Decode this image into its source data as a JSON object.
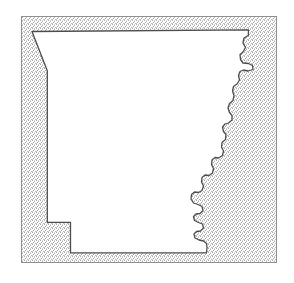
{
  "figure": {
    "title": "Arkansas state outline map",
    "caption": "",
    "subject": "Arkansas",
    "type": "state-outline-map"
  },
  "canvas": {
    "width": 294,
    "height": 283,
    "background_color": "#ffffff"
  },
  "bounding_box": {
    "name": "map-frame",
    "x": 21,
    "y": 16,
    "width": 256,
    "height": 247,
    "stroke_color": "#8f8f8f",
    "stroke_width": 1,
    "fill_color": "#dcdcdc",
    "fill_style": "stipple"
  },
  "state_shape": {
    "name": "arkansas-outline",
    "fill_color": "#ffffff",
    "stroke_color": "#4d4d4d",
    "stroke_width": 1.3,
    "path": "M 32.0 31.5 L 248.5 29.8 L 248.3 35.5 L 244.0 38.0 L 243.0 43.0 L 245.5 47.5 L 243.0 52.0 L 240.0 54.5 L 240.5 59.5 L 243.0 63.0 L 248.5 63.5 L 252.5 65.5 L 253.0 69.5 L 248.0 71.0 L 243.5 70.0 L 240.0 71.5 L 238.5 75.5 L 239.5 80.0 L 237.0 84.0 L 233.5 86.5 L 232.5 91.0 L 234.0 95.5 L 233.0 100.5 L 229.5 103.5 L 228.0 108.0 L 229.5 112.5 L 232.0 115.5 L 232.0 120.0 L 228.5 123.0 L 225.0 124.0 L 222.5 127.0 L 223.5 131.5 L 226.0 134.5 L 225.5 139.5 L 222.0 142.5 L 221.5 147.0 L 223.5 151.0 L 222.5 155.5 L 218.5 158.0 L 215.0 157.5 L 212.0 160.0 L 211.5 164.5 L 213.5 168.5 L 212.5 173.0 L 209.0 175.5 L 205.0 175.0 L 202.0 177.5 L 201.5 182.0 L 203.5 186.0 L 202.0 190.5 L 198.5 192.5 L 194.5 192.0 L 191.5 194.5 L 191.0 199.0 L 193.5 203.0 L 198.0 204.5 L 202.0 206.5 L 203.0 210.5 L 200.0 213.5 L 196.0 214.0 L 193.5 216.5 L 194.5 220.5 L 198.5 222.5 L 202.5 224.0 L 203.5 228.0 L 200.5 231.0 L 196.5 231.5 L 194.0 234.0 L 195.0 238.0 L 199.0 240.0 L 203.5 241.0 L 206.5 243.5 L 207.0 247.5 L 206.5 252.8 L 70.5 252.8 L 70.5 222.3 L 47.3 222.3 L 47.3 70.8 Z"
  },
  "elements": {
    "frame_label": "map-bounding-frame",
    "shape_label": "state-outline-path",
    "background_label": "map-background-fill"
  },
  "colors": {
    "frame_stroke": "#8f8f8f",
    "shape_stroke": "#4d4d4d",
    "shape_fill": "#ffffff",
    "stipple_fill": "#dcdcdc",
    "page_background": "#ffffff"
  }
}
